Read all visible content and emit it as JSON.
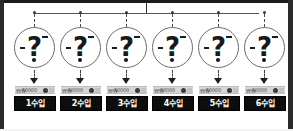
{
  "diagram": {
    "title": "",
    "type": "tree-fanout",
    "root": {
      "name": "root-bus",
      "connector_style": "solid-bus-with-dashed-drops"
    },
    "colors": {
      "frame": "#2a2a2a",
      "plate_bg": "#0d0d0d",
      "plate_text": "#ffffff",
      "chip_bg": "#d6d6d6",
      "line": "#555555",
      "circle_border": "#6d6d6d",
      "glyph": "#1a1a1a"
    },
    "node_glyph": "question-mark",
    "node_glyph_char": "?",
    "arrow_char": "↓",
    "nodes": [
      {
        "id": 1,
        "glyph": "?",
        "chip_value": "50000",
        "chip_pips": "₩₩",
        "label": "1수입"
      },
      {
        "id": 2,
        "glyph": "?",
        "chip_value": "50000",
        "chip_pips": "₩₩",
        "label": "2수입"
      },
      {
        "id": 3,
        "glyph": "?",
        "chip_value": "50000",
        "chip_pips": "₩₩",
        "label": "3수입"
      },
      {
        "id": 4,
        "glyph": "?",
        "chip_value": "50000",
        "chip_pips": "₩₩",
        "label": "4수입"
      },
      {
        "id": 5,
        "glyph": "?",
        "chip_value": "50000",
        "chip_pips": "₩₩",
        "label": "5수입"
      },
      {
        "id": 6,
        "glyph": "?",
        "chip_value": "50000",
        "chip_pips": "₩₩",
        "label": "6수입"
      }
    ]
  }
}
